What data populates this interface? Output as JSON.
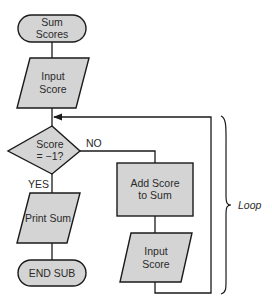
{
  "diagram": {
    "type": "flowchart",
    "colors": {
      "fill": "#d4d4d4",
      "stroke": "#1a1a1a",
      "text": "#2a2a2a",
      "background": "#ffffff"
    },
    "nodes": {
      "start": {
        "shape": "terminal",
        "line1": "Sum",
        "line2": "Scores"
      },
      "input1": {
        "shape": "parallelogram",
        "line1": "Input",
        "line2": "Score"
      },
      "decision": {
        "shape": "diamond",
        "line1": "Score",
        "line2": "= −1?"
      },
      "print": {
        "shape": "parallelogram",
        "line1": "Print Sum"
      },
      "end": {
        "shape": "terminal",
        "line1": "END SUB"
      },
      "add": {
        "shape": "rectangle",
        "line1": "Add Score",
        "line2": "to Sum"
      },
      "input2": {
        "shape": "parallelogram",
        "line1": "Input",
        "line2": "Score"
      }
    },
    "edges": {
      "no_label": "NO",
      "yes_label": "YES"
    },
    "annotation": {
      "label": "Loop"
    }
  }
}
